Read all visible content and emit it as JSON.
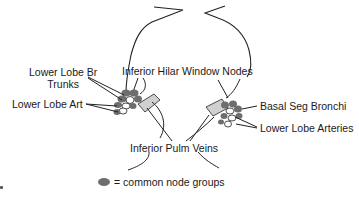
{
  "diagram": {
    "labels": {
      "lower_lobe_br_trunks_line1": "Lower Lobe Br",
      "lower_lobe_br_trunks_line2": "Trunks",
      "lower_lobe_art": "Lower Lobe Art",
      "inferior_hilar_window_nodes": "Inferior Hilar Window Nodes",
      "basal_seg_bronchi": "Basal Seg Bronchi",
      "lower_lobe_arteries": "Lower Lobe Arteries",
      "inferior_pulm_veins": "Inferior Pulm Veins"
    },
    "legend": {
      "symbol": "filled-gray-ellipse",
      "text": "= common node groups"
    },
    "colors": {
      "node_fill": "#6e6e6e",
      "vessel_fill": "#d0d0d0",
      "line": "#222222",
      "text": "#1a1a1a"
    }
  }
}
